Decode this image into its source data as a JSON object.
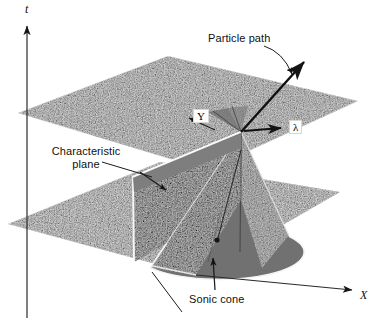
{
  "figure": {
    "title_alt": "Sonic cone and characteristic plane in x-y-t space",
    "background": "#ffffff",
    "plane_fill": "#8a8a8a",
    "plane_fill_dark": "#6e6e6e",
    "line_color": "#1a1a1a",
    "highlight_color": "#ffffff"
  },
  "axes": [
    {
      "name": "t-axis",
      "label": "t",
      "orientation": "vertical",
      "x": 27,
      "y": 4
    },
    {
      "name": "x-axis",
      "label": "X",
      "orientation": "diagonal-right-down",
      "x": 360,
      "y": 297
    }
  ],
  "labels": [
    {
      "name": "particle-path",
      "text": "Particle path",
      "x": 208,
      "y": 38
    },
    {
      "name": "characteristic-plane",
      "text": "Characteristic\nplane",
      "x": 40,
      "y": 146
    },
    {
      "name": "sonic-cone",
      "text": "Sonic cone",
      "x": 189,
      "y": 296
    }
  ],
  "boxed_labels": [
    {
      "name": "y-direction-label",
      "text": "Y",
      "x": 193,
      "y": 111
    },
    {
      "name": "lambda-label",
      "text": "λ",
      "x": 289,
      "y": 122
    }
  ],
  "geometry": {
    "upper_plane_points": "18,113 168,56 358,101 207,170",
    "lower_plane_points": "8,224 160,162 340,192 196,275",
    "particle_path": {
      "from_x": 241,
      "from_y": 132,
      "to_x": 304,
      "to_y": 62
    },
    "cone_apex": {
      "x": 241,
      "y": 132
    },
    "lambda_arrow": {
      "from_x": 244,
      "from_y": 131,
      "to_x": 282,
      "to_y": 128
    }
  }
}
